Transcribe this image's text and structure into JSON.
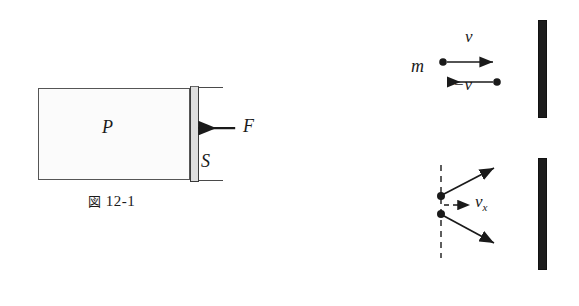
{
  "page": {
    "background_color": "#ffffff",
    "ink_color": "#1a1a1a",
    "width": 579,
    "height": 306
  },
  "figure_12_1": {
    "caption_zu": "図",
    "caption_number": "12-1",
    "caption_full": "図 12-1",
    "labels": {
      "pressure": "P",
      "area": "S",
      "force": "F"
    },
    "gas_fill": "#fbfbfb",
    "stipple_color": "#9a9a9a",
    "piston_color": "#dedede",
    "outline_color": "#555555",
    "force_arrow_direction": "left"
  },
  "figure_12_2": {
    "caption_zu": "図",
    "caption_number": "12-2",
    "caption_full": "図 12-2",
    "labels": {
      "mass": "m",
      "velocity_in": "v",
      "velocity_out": "−v",
      "velocity_x": "v",
      "velocity_x_subscript": "x"
    },
    "wall_color": "#1c1c1c",
    "upper_panel": {
      "incoming_arrow_direction": "right",
      "outgoing_arrow_direction": "left"
    },
    "lower_panel": {
      "dashed_line": "vertical",
      "incoming_arrow_direction": "up-right",
      "outgoing_arrow_direction": "down-right",
      "component_arrow_direction": "right-dashed"
    }
  }
}
